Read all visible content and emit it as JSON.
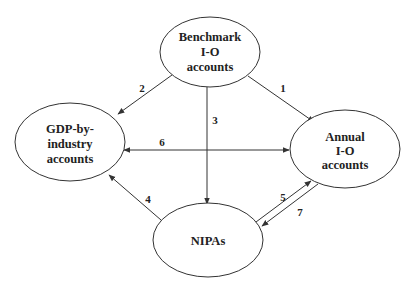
{
  "diagram": {
    "nodes": {
      "benchmark": {
        "lines": [
          "Benchmark",
          "I-O",
          "accounts"
        ]
      },
      "gdp": {
        "lines": [
          "GDP-by-",
          "industry",
          "accounts"
        ]
      },
      "annual": {
        "lines": [
          "Annual",
          "I-O",
          "accounts"
        ]
      },
      "nipas": {
        "lines": [
          "NIPAs"
        ]
      }
    },
    "edges": [
      {
        "label": "1",
        "from": "Benchmark I-O accounts",
        "to": "Annual I-O accounts"
      },
      {
        "label": "2",
        "from": "Benchmark I-O accounts",
        "to": "GDP-by-industry accounts"
      },
      {
        "label": "3",
        "from": "Benchmark I-O accounts",
        "to": "NIPAs"
      },
      {
        "label": "4",
        "from": "NIPAs",
        "to": "GDP-by-industry accounts"
      },
      {
        "label": "5",
        "from": "NIPAs",
        "to": "Annual I-O accounts"
      },
      {
        "label": "6",
        "from": "Annual I-O accounts",
        "to": "GDP-by-industry accounts",
        "bidirectional": true
      },
      {
        "label": "7",
        "from": "Annual I-O accounts",
        "to": "NIPAs"
      }
    ],
    "colors": {
      "stroke": "#333333",
      "text": "#222222",
      "background": "#ffffff"
    }
  }
}
